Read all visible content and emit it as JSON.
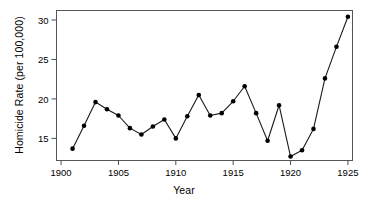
{
  "chart_data": {
    "type": "line",
    "title": "",
    "subtitle": "",
    "xlabel": "Year",
    "ylabel": "Homicide Rate (per 100,000)",
    "x": [
      1901,
      1902,
      1903,
      1904,
      1905,
      1906,
      1907,
      1908,
      1909,
      1910,
      1911,
      1912,
      1913,
      1914,
      1915,
      1916,
      1917,
      1918,
      1919,
      1920,
      1921,
      1922,
      1923,
      1924,
      1925
    ],
    "values": [
      13.7,
      16.6,
      19.6,
      18.7,
      17.9,
      16.3,
      15.5,
      16.5,
      17.4,
      15.0,
      17.8,
      20.5,
      17.9,
      18.2,
      19.7,
      21.6,
      18.2,
      14.7,
      19.2,
      12.7,
      13.5,
      16.2,
      22.6,
      26.6,
      30.4
    ],
    "series": [
      {
        "name": "Homicide Rate",
        "values": [
          13.7,
          16.6,
          19.6,
          18.7,
          17.9,
          16.3,
          15.5,
          16.5,
          17.4,
          15.0,
          17.8,
          20.5,
          17.9,
          18.2,
          19.7,
          21.6,
          18.2,
          14.7,
          19.2,
          12.7,
          13.5,
          16.2,
          22.6,
          26.6,
          30.4
        ]
      }
    ],
    "xlim": [
      1899.6,
      1925.4
    ],
    "ylim": [
      12.2,
      31.2
    ],
    "xticks": [
      1900,
      1905,
      1910,
      1915,
      1920,
      1925
    ],
    "xticklabels": [
      "1900",
      "1905",
      "1910",
      "1915",
      "1920",
      "1925"
    ],
    "yticks": [
      15,
      20,
      25,
      30
    ],
    "yticklabels": [
      "15",
      "20",
      "25",
      "30"
    ],
    "grid": false,
    "legend": null,
    "legend_position": "none",
    "marker": "filled-circle",
    "line_color": "#1a1a1a",
    "marker_color": "#000000",
    "axis_color": "#4d4d4d",
    "background_color": "#ffffff",
    "annotations": []
  }
}
